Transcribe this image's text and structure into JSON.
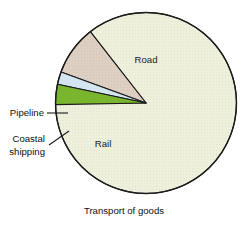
{
  "figure": {
    "caption": "Transport of goods",
    "background": "#ffffff"
  },
  "chart_data": {
    "type": "pie",
    "title": "Transport of goods",
    "xlabel": "",
    "ylabel": "",
    "categories": [
      "Road",
      "Rail",
      "Coastal shipping",
      "Pipeline"
    ],
    "values": [
      85.3,
      8.9,
      2.2,
      3.6
    ],
    "value_unit": "percent of goods transported",
    "start_angle_deg": 180,
    "direction": "clockwise",
    "grid": false,
    "legend": "none",
    "labels_placement": "inside-slice-and-callout",
    "slices": [
      {
        "name": "Road",
        "value": 85.3,
        "color": "#eff0dc",
        "label": "Road",
        "label_style": "inside",
        "start_deg": 232.0,
        "end_deg": 540.0
      },
      {
        "name": "Rail",
        "value": 8.9,
        "color": "#ddcfc2",
        "label": "Rail",
        "label_style": "inside",
        "start_deg": 200.0,
        "end_deg": 232.0
      },
      {
        "name": "Coastal shipping",
        "value": 2.2,
        "color": "#d3e5ef",
        "label": "Coastal shipping",
        "label_style": "callout",
        "start_deg": 192.0,
        "end_deg": 200.0
      },
      {
        "name": "Pipeline",
        "value": 3.6,
        "color": "#7ab530",
        "label": "Pipeline",
        "label_style": "callout",
        "start_deg": 179.0,
        "end_deg": 192.0
      }
    ],
    "geometry": {
      "center_x": 146,
      "center_y": 103,
      "radius": 90.5
    },
    "outline_color": "#1a1a1a"
  },
  "labels": {
    "road": "Road",
    "rail": "Rail",
    "pipeline": "Pipeline",
    "coastal_line1": "Coastal",
    "coastal_line2": "shipping",
    "caption": "Transport of goods"
  }
}
